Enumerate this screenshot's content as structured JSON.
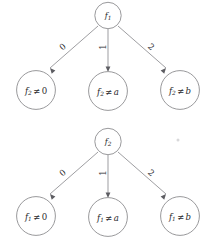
{
  "figure": {
    "background_color": "#ffffff",
    "stroke_color": "#8d8d90",
    "text_color": "#2b2b2e",
    "trees": [
      {
        "id": "tree-top",
        "root": {
          "func": "f",
          "sub": "2",
          "display": "f₂"
        },
        "root_display": {
          "func": "f",
          "sub": "1"
        },
        "edges": [
          {
            "label": "0",
            "target": "leaf-left"
          },
          {
            "label": "1",
            "target": "leaf-middle"
          },
          {
            "label": "2",
            "target": "leaf-right"
          }
        ],
        "leaves": [
          {
            "id": "leaf-left",
            "func": "f",
            "sub": "2",
            "rel": "≠",
            "value": "0",
            "value_italic": false
          },
          {
            "id": "leaf-middle",
            "func": "f",
            "sub": "2",
            "rel": "≠",
            "value": "a",
            "value_italic": true
          },
          {
            "id": "leaf-right",
            "func": "f",
            "sub": "2",
            "rel": "≠",
            "value": "b",
            "value_italic": true
          }
        ]
      },
      {
        "id": "tree-bottom",
        "root_display": {
          "func": "f",
          "sub": "2"
        },
        "edges": [
          {
            "label": "0",
            "target": "leaf-left"
          },
          {
            "label": "1",
            "target": "leaf-middle"
          },
          {
            "label": "2",
            "target": "leaf-right"
          }
        ],
        "leaves": [
          {
            "id": "leaf-left",
            "func": "f",
            "sub": "1",
            "rel": "≠",
            "value": "0",
            "value_italic": false
          },
          {
            "id": "leaf-middle",
            "func": "f",
            "sub": "1",
            "rel": "≠",
            "value": "a",
            "value_italic": true
          },
          {
            "id": "leaf-right",
            "func": "f",
            "sub": "1",
            "rel": "≠",
            "value": "b",
            "value_italic": true
          }
        ]
      }
    ],
    "tree_top": {
      "root": {
        "func": "f",
        "sub": "1"
      },
      "edge0": "0",
      "edge1": "1",
      "edge2": "2",
      "leaf_left": {
        "func": "f",
        "sub": "2",
        "rel": "≠",
        "value": "0"
      },
      "leaf_middle": {
        "func": "f",
        "sub": "2",
        "rel": "≠",
        "value": "a"
      },
      "leaf_right": {
        "func": "f",
        "sub": "2",
        "rel": "≠",
        "value": "b"
      }
    },
    "tree_bottom": {
      "root": {
        "func": "f",
        "sub": "2"
      },
      "edge0": "0",
      "edge1": "1",
      "edge2": "2",
      "leaf_left": {
        "func": "f",
        "sub": "1",
        "rel": "≠",
        "value": "0"
      },
      "leaf_middle": {
        "func": "f",
        "sub": "1",
        "rel": "≠",
        "value": "a"
      },
      "leaf_right": {
        "func": "f",
        "sub": "1",
        "rel": "≠",
        "value": "b"
      }
    }
  }
}
